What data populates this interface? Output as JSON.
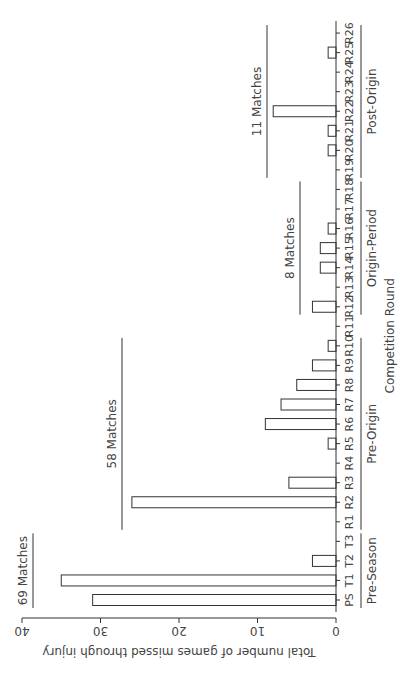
{
  "chart_data": {
    "type": "bar",
    "orientation_note": "figure rotated 90 degrees counter-clockwise",
    "title": "",
    "xlabel": "Competition Round",
    "ylabel": "Total number of games missed through injury",
    "ylim": [
      0,
      40
    ],
    "yticks": [
      0,
      10,
      20,
      30,
      40
    ],
    "grid": false,
    "categories": [
      "PS",
      "T1",
      "T2",
      "T3",
      "R1",
      "R2",
      "R3",
      "R4",
      "R5",
      "R6",
      "R7",
      "R8",
      "R9",
      "R10",
      "R11",
      "R12",
      "R13",
      "R14",
      "R15",
      "R16",
      "R17",
      "R18",
      "R19",
      "R20",
      "R21",
      "R22",
      "R23",
      "R24",
      "R25",
      "R26"
    ],
    "values": [
      31,
      35,
      3,
      0,
      0,
      26,
      6,
      0,
      1,
      9,
      7,
      5,
      3,
      1,
      0,
      3,
      0,
      2,
      2,
      1,
      0,
      0,
      0,
      1,
      1,
      8,
      0,
      0,
      1,
      0
    ],
    "phases": [
      {
        "name": "Pre-Season",
        "from": "PS",
        "to": "T3",
        "matches_label": "69 Matches"
      },
      {
        "name": "Pre-Origin",
        "from": "R1",
        "to": "R10",
        "matches_label": "58 Matches"
      },
      {
        "name": "Origin-Period",
        "from": "R12",
        "to": "R18",
        "matches_label": "8 Matches"
      },
      {
        "name": "Post-Origin",
        "from": "R19",
        "to": "R26",
        "matches_label": "11 Matches"
      }
    ],
    "bar_fill": "#ffffff",
    "bar_stroke": "#333333"
  }
}
